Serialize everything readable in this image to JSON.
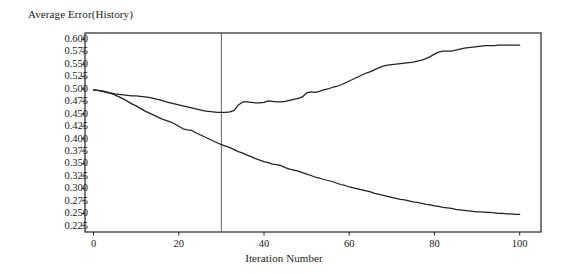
{
  "chart_data": {
    "type": "line",
    "title": "",
    "ylabel": "Average Error(History)",
    "xlabel": "Iteration Number",
    "xlim": [
      -2,
      105
    ],
    "ylim": [
      0.2125,
      0.6125
    ],
    "grid": false,
    "legend": "none",
    "x_ticks": [
      "0",
      "20",
      "40",
      "60",
      "80",
      "100"
    ],
    "x_tick_values": [
      0,
      20,
      40,
      60,
      80,
      100
    ],
    "y_ticks": [
      "0.600",
      "0.575",
      "0.550",
      "0.525",
      "0.500",
      "0.475",
      "0.450",
      "0.425",
      "0.400",
      "0.375",
      "0.350",
      "0.325",
      "0.300",
      "0.275",
      "0.250",
      "0.225"
    ],
    "y_tick_values": [
      0.6,
      0.575,
      0.55,
      0.525,
      0.5,
      0.475,
      0.45,
      0.425,
      0.4,
      0.375,
      0.35,
      0.325,
      0.3,
      0.275,
      0.25,
      0.225
    ],
    "annotations": [
      {
        "name": "vertical-marker",
        "type": "vline",
        "x": 30
      }
    ],
    "line_color": "#222222",
    "series": [
      {
        "name": "upper-curve",
        "x": [
          0,
          1,
          2,
          3,
          4,
          5,
          6,
          7,
          8,
          9,
          10,
          11,
          12,
          13,
          14,
          15,
          16,
          17,
          18,
          19,
          20,
          21,
          22,
          23,
          24,
          25,
          26,
          27,
          28,
          29,
          30,
          31,
          32,
          33,
          34,
          35,
          36,
          37,
          38,
          39,
          40,
          41,
          42,
          43,
          44,
          45,
          46,
          47,
          48,
          49,
          50,
          51,
          52,
          53,
          54,
          55,
          56,
          57,
          58,
          59,
          60,
          61,
          62,
          63,
          64,
          65,
          66,
          67,
          68,
          69,
          70,
          71,
          72,
          73,
          74,
          75,
          76,
          77,
          78,
          79,
          80,
          81,
          82,
          83,
          84,
          85,
          86,
          87,
          88,
          89,
          90,
          91,
          92,
          93,
          94,
          95,
          96,
          97,
          98,
          99,
          100
        ],
        "values": [
          0.498,
          0.497,
          0.496,
          0.494,
          0.492,
          0.49,
          0.489,
          0.488,
          0.487,
          0.486,
          0.486,
          0.485,
          0.484,
          0.483,
          0.481,
          0.479,
          0.477,
          0.474,
          0.472,
          0.47,
          0.468,
          0.466,
          0.464,
          0.462,
          0.46,
          0.458,
          0.456,
          0.455,
          0.454,
          0.453,
          0.453,
          0.453,
          0.454,
          0.457,
          0.468,
          0.474,
          0.474,
          0.473,
          0.472,
          0.472,
          0.473,
          0.476,
          0.475,
          0.474,
          0.474,
          0.475,
          0.477,
          0.479,
          0.481,
          0.484,
          0.492,
          0.494,
          0.493,
          0.495,
          0.498,
          0.5,
          0.503,
          0.505,
          0.508,
          0.512,
          0.516,
          0.52,
          0.524,
          0.528,
          0.532,
          0.535,
          0.539,
          0.543,
          0.546,
          0.548,
          0.549,
          0.55,
          0.551,
          0.552,
          0.553,
          0.554,
          0.556,
          0.558,
          0.561,
          0.565,
          0.57,
          0.574,
          0.576,
          0.576,
          0.576,
          0.578,
          0.58,
          0.582,
          0.583,
          0.584,
          0.585,
          0.586,
          0.587,
          0.587,
          0.587,
          0.588,
          0.588,
          0.588,
          0.588,
          0.588,
          0.588
        ]
      },
      {
        "name": "lower-curve",
        "x": [
          0,
          1,
          2,
          3,
          4,
          5,
          6,
          7,
          8,
          9,
          10,
          11,
          12,
          13,
          14,
          15,
          16,
          17,
          18,
          19,
          20,
          21,
          22,
          23,
          24,
          25,
          26,
          27,
          28,
          29,
          30,
          31,
          32,
          33,
          34,
          35,
          36,
          37,
          38,
          39,
          40,
          41,
          42,
          43,
          44,
          45,
          46,
          47,
          48,
          49,
          50,
          51,
          52,
          53,
          54,
          55,
          56,
          57,
          58,
          59,
          60,
          61,
          62,
          63,
          64,
          65,
          66,
          67,
          68,
          69,
          70,
          71,
          72,
          73,
          74,
          75,
          76,
          77,
          78,
          79,
          80,
          81,
          82,
          83,
          84,
          85,
          86,
          87,
          88,
          89,
          90,
          91,
          92,
          93,
          94,
          95,
          96,
          97,
          98,
          99,
          100
        ],
        "values": [
          0.498,
          0.497,
          0.495,
          0.493,
          0.491,
          0.488,
          0.484,
          0.48,
          0.475,
          0.47,
          0.466,
          0.461,
          0.456,
          0.452,
          0.448,
          0.444,
          0.44,
          0.437,
          0.434,
          0.43,
          0.425,
          0.42,
          0.418,
          0.417,
          0.412,
          0.408,
          0.404,
          0.4,
          0.396,
          0.392,
          0.388,
          0.385,
          0.382,
          0.378,
          0.374,
          0.371,
          0.367,
          0.364,
          0.36,
          0.357,
          0.354,
          0.352,
          0.349,
          0.348,
          0.346,
          0.342,
          0.339,
          0.337,
          0.335,
          0.332,
          0.329,
          0.326,
          0.323,
          0.321,
          0.318,
          0.316,
          0.314,
          0.311,
          0.308,
          0.306,
          0.303,
          0.301,
          0.299,
          0.297,
          0.295,
          0.293,
          0.29,
          0.288,
          0.286,
          0.284,
          0.282,
          0.28,
          0.278,
          0.277,
          0.275,
          0.273,
          0.272,
          0.27,
          0.268,
          0.267,
          0.265,
          0.264,
          0.262,
          0.261,
          0.26,
          0.258,
          0.257,
          0.256,
          0.255,
          0.254,
          0.253,
          0.253,
          0.252,
          0.252,
          0.251,
          0.25,
          0.25,
          0.249,
          0.249,
          0.248,
          0.248
        ]
      }
    ]
  }
}
